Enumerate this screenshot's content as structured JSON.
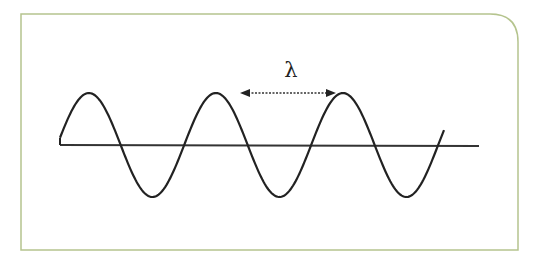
{
  "diagram": {
    "type": "transverse-wave",
    "wavelength_label": "λ",
    "colors": {
      "frame_border": "#b5c48e",
      "wave_stroke": "#222222",
      "baseline_stroke": "#333333",
      "arrow_stroke": "#333333",
      "background": "#ffffff"
    },
    "wave": {
      "start_x": 60,
      "end_x": 444,
      "baseline_y": 145,
      "amplitude": 52,
      "period_px": 127,
      "cycles": 3
    },
    "baseline": {
      "x1": 60,
      "x2": 479
    },
    "wavelength_arrow": {
      "x1": 240,
      "x2": 336,
      "y": 93,
      "style": "dashed-double-arrow"
    },
    "frame": {
      "x": 21,
      "y": 14,
      "width": 497,
      "height": 236,
      "top_right_radius": 28
    }
  }
}
